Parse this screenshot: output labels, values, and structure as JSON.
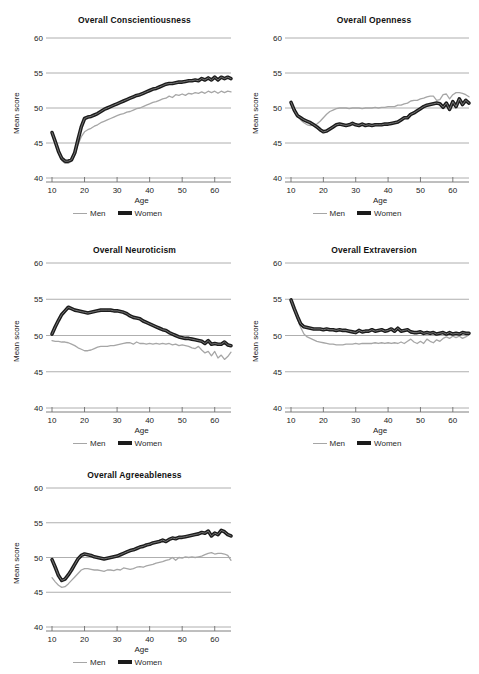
{
  "figure": {
    "series_names": [
      "Men",
      "Women"
    ],
    "colors": {
      "men": "#a6a6a6",
      "women": "#1b1b1b",
      "grid": "#9b9b9b",
      "axis": "#6f6f6f"
    },
    "legend": {
      "men_label": "Men",
      "women_label": "Women"
    },
    "axis": {
      "xlabel": "Age",
      "ylabel": "Mean score",
      "yticks": [
        "40",
        "45",
        "50",
        "55",
        "60"
      ],
      "xticks": [
        "10",
        "20",
        "30",
        "40",
        "50",
        "60"
      ],
      "xlim": [
        10,
        65
      ],
      "ylim": [
        40,
        60
      ]
    }
  },
  "chart_data": [
    {
      "type": "line",
      "title": "Overall Conscientiousness",
      "xlabel": "Age",
      "ylabel": "Mean score",
      "xlim": [
        10,
        65
      ],
      "ylim": [
        40,
        60
      ],
      "grid": true,
      "legend_position": "below",
      "x": [
        10,
        11,
        12,
        13,
        14,
        15,
        16,
        17,
        18,
        19,
        20,
        21,
        22,
        23,
        24,
        25,
        26,
        27,
        28,
        29,
        30,
        31,
        32,
        33,
        34,
        35,
        36,
        37,
        38,
        39,
        40,
        41,
        42,
        43,
        44,
        45,
        46,
        47,
        48,
        49,
        50,
        51,
        52,
        53,
        54,
        55,
        56,
        57,
        58,
        59,
        60,
        61,
        62,
        63,
        64,
        65
      ],
      "series": [
        {
          "name": "Men",
          "values": [
            46.3,
            45.0,
            43.6,
            42.5,
            42.1,
            42.1,
            42.4,
            43.3,
            44.8,
            45.9,
            46.6,
            46.9,
            47.1,
            47.4,
            47.6,
            47.9,
            48.1,
            48.3,
            48.5,
            48.7,
            48.9,
            49.1,
            49.2,
            49.4,
            49.5,
            49.7,
            49.9,
            50.0,
            50.2,
            50.4,
            50.6,
            50.8,
            50.9,
            51.1,
            51.3,
            51.4,
            51.7,
            51.5,
            51.9,
            51.8,
            52.0,
            51.8,
            52.1,
            52.0,
            52.2,
            52.1,
            52.3,
            52.1,
            52.4,
            52.2,
            52.4,
            52.1,
            52.4,
            52.2,
            52.4,
            52.3
          ]
        },
        {
          "name": "Women",
          "values": [
            46.5,
            45.2,
            43.8,
            42.8,
            42.4,
            42.4,
            42.6,
            43.6,
            45.5,
            47.3,
            48.5,
            48.7,
            48.8,
            49.0,
            49.2,
            49.5,
            49.8,
            50.0,
            50.2,
            50.4,
            50.6,
            50.8,
            51.0,
            51.2,
            51.4,
            51.6,
            51.8,
            51.9,
            52.1,
            52.3,
            52.5,
            52.7,
            52.8,
            53.0,
            53.2,
            53.4,
            53.5,
            53.5,
            53.6,
            53.7,
            53.7,
            53.8,
            53.9,
            53.9,
            54.0,
            53.9,
            54.2,
            54.0,
            54.3,
            54.0,
            54.4,
            54.0,
            54.4,
            54.2,
            54.4,
            54.2
          ]
        }
      ]
    },
    {
      "type": "line",
      "title": "Overall Openness",
      "xlabel": "Age",
      "ylabel": "Mean score",
      "xlim": [
        10,
        65
      ],
      "ylim": [
        40,
        60
      ],
      "grid": true,
      "legend_position": "below",
      "x": [
        10,
        11,
        12,
        13,
        14,
        15,
        16,
        17,
        18,
        19,
        20,
        21,
        22,
        23,
        24,
        25,
        26,
        27,
        28,
        29,
        30,
        31,
        32,
        33,
        34,
        35,
        36,
        37,
        38,
        39,
        40,
        41,
        42,
        43,
        44,
        45,
        46,
        47,
        48,
        49,
        50,
        51,
        52,
        53,
        54,
        55,
        56,
        57,
        58,
        59,
        60,
        61,
        62,
        63,
        64,
        65
      ],
      "series": [
        {
          "name": "Men",
          "values": [
            50.9,
            49.8,
            48.9,
            48.3,
            47.9,
            47.6,
            47.5,
            47.6,
            47.7,
            48.1,
            48.6,
            49.1,
            49.5,
            49.7,
            49.9,
            50.0,
            50.0,
            50.0,
            49.9,
            50.0,
            50.0,
            50.0,
            49.9,
            50.0,
            50.0,
            50.0,
            50.1,
            50.0,
            50.1,
            50.1,
            50.2,
            50.2,
            50.2,
            50.4,
            50.4,
            50.6,
            50.7,
            51.0,
            51.1,
            51.1,
            51.3,
            51.4,
            51.6,
            51.7,
            51.7,
            51.1,
            51.2,
            51.9,
            52.0,
            51.3,
            51.9,
            52.2,
            52.2,
            52.1,
            51.9,
            51.6
          ]
        },
        {
          "name": "Women",
          "values": [
            50.8,
            49.7,
            48.9,
            48.6,
            48.3,
            48.1,
            47.9,
            47.6,
            47.3,
            46.9,
            46.6,
            46.7,
            47.0,
            47.3,
            47.6,
            47.7,
            47.6,
            47.5,
            47.6,
            47.8,
            47.6,
            47.5,
            47.7,
            47.5,
            47.6,
            47.5,
            47.6,
            47.6,
            47.6,
            47.7,
            47.7,
            47.8,
            47.9,
            48.0,
            48.3,
            48.6,
            48.6,
            49.1,
            49.3,
            49.6,
            49.9,
            50.2,
            50.4,
            50.5,
            50.6,
            50.7,
            50.6,
            50.1,
            50.7,
            49.8,
            50.9,
            50.2,
            51.3,
            50.5,
            51.1,
            50.7
          ]
        }
      ]
    },
    {
      "type": "line",
      "title": "Overall Neuroticism",
      "xlabel": "Age",
      "ylabel": "Mean score",
      "xlim": [
        10,
        65
      ],
      "ylim": [
        40,
        60
      ],
      "grid": true,
      "legend_position": "below",
      "x": [
        10,
        11,
        12,
        13,
        14,
        15,
        16,
        17,
        18,
        19,
        20,
        21,
        22,
        23,
        24,
        25,
        26,
        27,
        28,
        29,
        30,
        31,
        32,
        33,
        34,
        35,
        36,
        37,
        38,
        39,
        40,
        41,
        42,
        43,
        44,
        45,
        46,
        47,
        48,
        49,
        50,
        51,
        52,
        53,
        54,
        55,
        56,
        57,
        58,
        59,
        60,
        61,
        62,
        63,
        64,
        65
      ],
      "series": [
        {
          "name": "Men",
          "values": [
            49.3,
            49.2,
            49.2,
            49.1,
            49.1,
            49.0,
            48.8,
            48.6,
            48.3,
            48.1,
            47.9,
            47.9,
            48.0,
            48.2,
            48.4,
            48.5,
            48.5,
            48.5,
            48.6,
            48.6,
            48.7,
            48.8,
            48.9,
            49.0,
            49.0,
            48.8,
            49.1,
            48.9,
            48.9,
            48.8,
            48.9,
            48.8,
            48.9,
            48.8,
            48.9,
            48.8,
            48.9,
            48.7,
            48.8,
            48.6,
            48.7,
            48.6,
            48.5,
            48.3,
            48.2,
            48.5,
            48.0,
            47.6,
            47.8,
            47.2,
            47.8,
            46.9,
            47.3,
            46.7,
            47.1,
            47.7
          ]
        },
        {
          "name": "Women",
          "values": [
            50.2,
            51.2,
            52.1,
            52.9,
            53.4,
            53.9,
            53.7,
            53.5,
            53.4,
            53.3,
            53.2,
            53.1,
            53.2,
            53.3,
            53.4,
            53.5,
            53.5,
            53.5,
            53.5,
            53.4,
            53.4,
            53.3,
            53.2,
            53.0,
            52.7,
            52.5,
            52.4,
            52.3,
            52.0,
            51.8,
            51.6,
            51.4,
            51.2,
            51.0,
            50.8,
            50.7,
            50.4,
            50.2,
            50.0,
            49.8,
            49.7,
            49.6,
            49.6,
            49.5,
            49.4,
            49.3,
            49.2,
            48.9,
            49.3,
            48.8,
            48.9,
            48.8,
            48.8,
            49.1,
            48.7,
            48.6
          ]
        }
      ]
    },
    {
      "type": "line",
      "title": "Overall Extraversion",
      "xlabel": "Age",
      "ylabel": "Mean score",
      "xlim": [
        10,
        65
      ],
      "ylim": [
        40,
        60
      ],
      "grid": true,
      "legend_position": "below",
      "x": [
        10,
        11,
        12,
        13,
        14,
        15,
        16,
        17,
        18,
        19,
        20,
        21,
        22,
        23,
        24,
        25,
        26,
        27,
        28,
        29,
        30,
        31,
        32,
        33,
        34,
        35,
        36,
        37,
        38,
        39,
        40,
        41,
        42,
        43,
        44,
        45,
        46,
        47,
        48,
        49,
        50,
        51,
        52,
        53,
        54,
        55,
        56,
        57,
        58,
        59,
        60,
        61,
        62,
        63,
        64,
        65
      ],
      "series": [
        {
          "name": "Men",
          "values": [
            54.8,
            53.5,
            52.3,
            51.1,
            50.2,
            49.8,
            49.6,
            49.4,
            49.2,
            49.1,
            49.0,
            48.9,
            48.8,
            48.8,
            48.7,
            48.7,
            48.7,
            48.8,
            48.8,
            48.8,
            48.9,
            48.8,
            48.9,
            48.9,
            48.9,
            48.9,
            49.0,
            48.9,
            49.0,
            48.9,
            49.0,
            48.9,
            49.0,
            48.9,
            49.1,
            48.9,
            49.2,
            49.5,
            49.1,
            48.9,
            49.2,
            48.9,
            49.5,
            49.2,
            49.0,
            49.4,
            49.2,
            49.6,
            49.8,
            49.6,
            49.9,
            49.7,
            49.9,
            49.6,
            49.8,
            50.1
          ]
        },
        {
          "name": "Women",
          "values": [
            54.9,
            53.7,
            52.6,
            51.6,
            51.2,
            51.1,
            51.0,
            50.9,
            50.9,
            50.9,
            50.8,
            50.9,
            50.8,
            50.8,
            50.7,
            50.8,
            50.7,
            50.7,
            50.6,
            50.5,
            50.4,
            50.7,
            50.5,
            50.6,
            50.6,
            50.8,
            50.6,
            50.7,
            50.8,
            50.6,
            50.7,
            50.9,
            50.6,
            51.0,
            50.6,
            50.7,
            50.8,
            50.5,
            50.4,
            50.4,
            50.5,
            50.3,
            50.4,
            50.3,
            50.4,
            50.2,
            50.3,
            50.4,
            50.2,
            50.4,
            50.2,
            50.3,
            50.2,
            50.4,
            50.3,
            50.3
          ]
        }
      ]
    },
    {
      "type": "line",
      "title": "Overall Agreeableness",
      "xlabel": "Age",
      "ylabel": "Mean score",
      "xlim": [
        10,
        65
      ],
      "ylim": [
        40,
        60
      ],
      "grid": true,
      "legend_position": "below",
      "x": [
        10,
        11,
        12,
        13,
        14,
        15,
        16,
        17,
        18,
        19,
        20,
        21,
        22,
        23,
        24,
        25,
        26,
        27,
        28,
        29,
        30,
        31,
        32,
        33,
        34,
        35,
        36,
        37,
        38,
        39,
        40,
        41,
        42,
        43,
        44,
        45,
        46,
        47,
        48,
        49,
        50,
        51,
        52,
        53,
        54,
        55,
        56,
        57,
        58,
        59,
        60,
        61,
        62,
        63,
        64,
        65
      ],
      "series": [
        {
          "name": "Men",
          "values": [
            47.1,
            46.5,
            46.0,
            45.7,
            45.8,
            46.2,
            46.7,
            47.2,
            47.7,
            48.2,
            48.4,
            48.4,
            48.3,
            48.2,
            48.2,
            48.1,
            48.0,
            48.2,
            48.2,
            48.1,
            48.3,
            48.2,
            48.5,
            48.4,
            48.3,
            48.4,
            48.6,
            48.7,
            48.6,
            48.8,
            48.9,
            49.0,
            49.2,
            49.3,
            49.4,
            49.6,
            49.7,
            50.0,
            49.6,
            50.0,
            49.9,
            50.1,
            50.0,
            50.1,
            50.0,
            50.1,
            50.2,
            50.4,
            50.6,
            50.7,
            50.5,
            50.6,
            50.6,
            50.5,
            50.3,
            49.6
          ]
        },
        {
          "name": "Women",
          "values": [
            49.7,
            48.6,
            47.4,
            46.7,
            46.9,
            47.5,
            48.2,
            49.0,
            49.8,
            50.3,
            50.5,
            50.4,
            50.3,
            50.1,
            50.0,
            49.9,
            49.8,
            49.9,
            50.0,
            50.1,
            50.2,
            50.4,
            50.6,
            50.8,
            51.0,
            51.1,
            51.3,
            51.5,
            51.6,
            51.8,
            51.9,
            52.1,
            52.2,
            52.3,
            52.5,
            52.3,
            52.6,
            52.8,
            52.7,
            52.9,
            52.9,
            53.0,
            53.1,
            53.2,
            53.3,
            53.4,
            53.6,
            53.5,
            53.8,
            53.1,
            53.5,
            53.3,
            53.9,
            53.7,
            53.3,
            53.1
          ]
        }
      ]
    }
  ]
}
